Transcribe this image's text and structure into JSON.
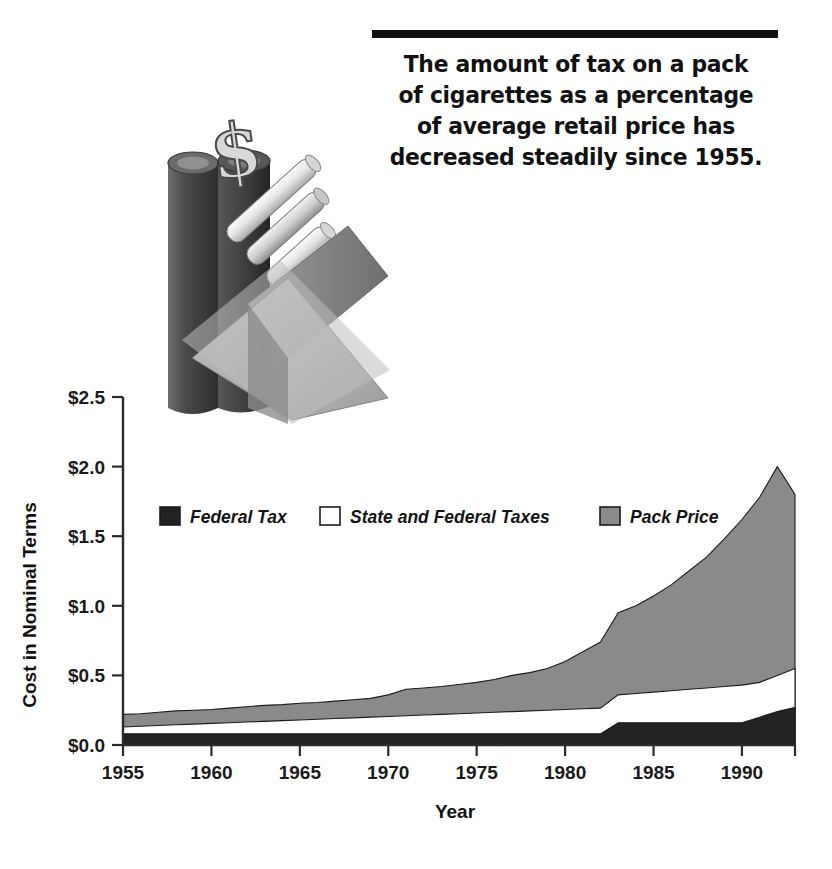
{
  "headline": {
    "lines": [
      "The amount of tax on a pack",
      "of cigarettes as a percentage",
      "of average retail price has",
      "decreased steadily since 1955."
    ],
    "rule_color": "#111111"
  },
  "illustration": {
    "name": "cigarette-pack-with-dollar-sign",
    "description": "Grayscale 3D illustration of a tall dark cylinder topped with a dollar sign beside an open tilted cigarette pack with cigarettes protruding"
  },
  "chart_data": {
    "type": "area",
    "stacked": false,
    "title": "",
    "xlabel": "Year",
    "ylabel": "Cost in Nominal Terms",
    "xlim": [
      1955,
      1993
    ],
    "ylim": [
      0.0,
      2.5
    ],
    "xticks": [
      1955,
      1960,
      1965,
      1970,
      1975,
      1980,
      1985,
      1990
    ],
    "xtick_labels": [
      "1955",
      "1960",
      "1965",
      "1970",
      "1975",
      "1980",
      "1985",
      "1990"
    ],
    "yticks": [
      0.0,
      0.5,
      1.0,
      1.5,
      2.0,
      2.5
    ],
    "ytick_labels": [
      "$0.0",
      "$0.5",
      "$1.0",
      "$1.5",
      "$2.0",
      "$2.5"
    ],
    "grid": false,
    "legend_position": "inside-upper-left",
    "x": [
      1955,
      1956,
      1957,
      1958,
      1959,
      1960,
      1961,
      1962,
      1963,
      1964,
      1965,
      1966,
      1967,
      1968,
      1969,
      1970,
      1971,
      1972,
      1973,
      1974,
      1975,
      1976,
      1977,
      1978,
      1979,
      1980,
      1981,
      1982,
      1983,
      1984,
      1985,
      1986,
      1987,
      1988,
      1989,
      1990,
      1991,
      1992,
      1993
    ],
    "series": [
      {
        "name": "Federal Tax",
        "color": "#222222",
        "swatch": "filled-dark",
        "values": [
          0.08,
          0.08,
          0.08,
          0.08,
          0.08,
          0.08,
          0.08,
          0.08,
          0.08,
          0.08,
          0.08,
          0.08,
          0.08,
          0.08,
          0.08,
          0.08,
          0.08,
          0.08,
          0.08,
          0.08,
          0.08,
          0.08,
          0.08,
          0.08,
          0.08,
          0.08,
          0.08,
          0.08,
          0.16,
          0.16,
          0.16,
          0.16,
          0.16,
          0.16,
          0.16,
          0.16,
          0.2,
          0.24,
          0.27
        ]
      },
      {
        "name": "State and Federal Taxes",
        "color": "#ffffff",
        "swatch": "outlined-white",
        "values": [
          0.13,
          0.135,
          0.14,
          0.145,
          0.15,
          0.155,
          0.16,
          0.165,
          0.17,
          0.175,
          0.18,
          0.185,
          0.19,
          0.195,
          0.2,
          0.205,
          0.21,
          0.215,
          0.22,
          0.225,
          0.23,
          0.235,
          0.24,
          0.245,
          0.25,
          0.255,
          0.26,
          0.265,
          0.36,
          0.37,
          0.38,
          0.39,
          0.4,
          0.41,
          0.42,
          0.43,
          0.45,
          0.5,
          0.55
        ]
      },
      {
        "name": "Pack Price",
        "color": "#8a8a8a",
        "swatch": "filled-gray",
        "values": [
          0.22,
          0.225,
          0.235,
          0.245,
          0.25,
          0.255,
          0.265,
          0.275,
          0.285,
          0.29,
          0.3,
          0.305,
          0.315,
          0.325,
          0.335,
          0.36,
          0.4,
          0.41,
          0.42,
          0.435,
          0.45,
          0.47,
          0.5,
          0.52,
          0.55,
          0.6,
          0.67,
          0.74,
          0.95,
          1.0,
          1.07,
          1.15,
          1.25,
          1.35,
          1.48,
          1.62,
          1.78,
          2.0,
          1.8
        ]
      }
    ]
  }
}
